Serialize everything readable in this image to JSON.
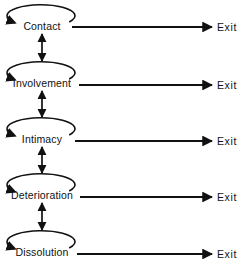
{
  "diagram": {
    "type": "flow-diagram",
    "title": "",
    "stage_label_center_x": 42,
    "exit_label_x": 217,
    "loop_icon_name": "self-loop-arrow-icon",
    "vertical_icon_name": "double-headed-arrow-icon",
    "exit_icon_name": "right-arrow-icon",
    "colors": {
      "stroke": "#111111",
      "text": "#111111",
      "background": "#ffffff"
    },
    "stages": [
      {
        "label": "Contact",
        "exit_label": "Exit",
        "y": 26,
        "loop": {
          "cx": 42,
          "cy": 14,
          "rx": 34,
          "ry": 11
        },
        "exit_line": {
          "x1": 72,
          "x2": 212,
          "y": 27
        },
        "text_half_width": 19
      },
      {
        "label": "Involvement",
        "exit_label": "Exit",
        "y": 83,
        "loop": {
          "cx": 42,
          "cy": 71,
          "rx": 34,
          "ry": 11
        },
        "exit_line": {
          "x1": 79,
          "x2": 212,
          "y": 85
        },
        "text_half_width": 27
      },
      {
        "label": "Intimacy",
        "exit_label": "Exit",
        "y": 139,
        "loop": {
          "cx": 42,
          "cy": 127,
          "rx": 34,
          "ry": 11
        },
        "exit_line": {
          "x1": 75,
          "x2": 212,
          "y": 141
        },
        "text_half_width": 21
      },
      {
        "label": "Deterioration",
        "exit_label": "Exit",
        "y": 195,
        "loop": {
          "cx": 42,
          "cy": 183,
          "rx": 34,
          "ry": 11
        },
        "exit_line": {
          "x1": 80,
          "x2": 212,
          "y": 197
        },
        "text_half_width": 29
      },
      {
        "label": "Dissolution",
        "exit_label": "Exit",
        "y": 252,
        "loop": {
          "cx": 42,
          "cy": 240,
          "rx": 34,
          "ry": 11
        },
        "exit_line": {
          "x1": 77,
          "x2": 212,
          "y": 254
        },
        "text_half_width": 26
      }
    ],
    "connectors": [
      {
        "from": "Contact",
        "to": "Involvement",
        "x": 42,
        "y1": 34,
        "y2": 61,
        "double_headed": true
      },
      {
        "from": "Involvement",
        "to": "Intimacy",
        "x": 42,
        "y1": 91,
        "y2": 117,
        "double_headed": true
      },
      {
        "from": "Intimacy",
        "to": "Deterioration",
        "x": 42,
        "y1": 147,
        "y2": 173,
        "double_headed": true
      },
      {
        "from": "Deterioration",
        "to": "Dissolution",
        "x": 42,
        "y1": 203,
        "y2": 230,
        "double_headed": true
      }
    ]
  }
}
